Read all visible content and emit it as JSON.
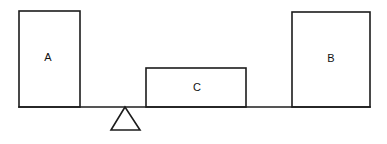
{
  "diagram": {
    "kind": "lever-balance-line-drawing",
    "background_color": "#ffffff",
    "stroke_color": "#1c1c1c",
    "label_color": "#111111",
    "canvas": {
      "width": 387,
      "height": 144
    },
    "blocks": [
      {
        "id": "block-a",
        "label": "A",
        "shape": "rectangle",
        "x": 19,
        "y": 11,
        "width": 61,
        "height": 96,
        "label_x": 48,
        "label_y": 58,
        "position": "left-end-of-beam"
      },
      {
        "id": "block-c",
        "label": "C",
        "shape": "rectangle",
        "x": 146,
        "y": 68,
        "width": 100,
        "height": 39,
        "label_x": 197,
        "label_y": 88,
        "position": "middle-right-of-fulcrum"
      },
      {
        "id": "block-b",
        "label": "B",
        "shape": "rectangle",
        "x": 292,
        "y": 12,
        "width": 78,
        "height": 95,
        "label_x": 331,
        "label_y": 59,
        "position": "right-end-of-beam"
      }
    ],
    "beam": {
      "id": "beam",
      "shape": "horizontal-line",
      "x1": 19,
      "y1": 107,
      "x2": 370,
      "y2": 107
    },
    "fulcrum": {
      "id": "fulcrum",
      "shape": "triangle",
      "apex_x": 125,
      "apex_y": 107,
      "base_left_x": 111,
      "base_right_x": 140,
      "base_y": 130
    }
  }
}
